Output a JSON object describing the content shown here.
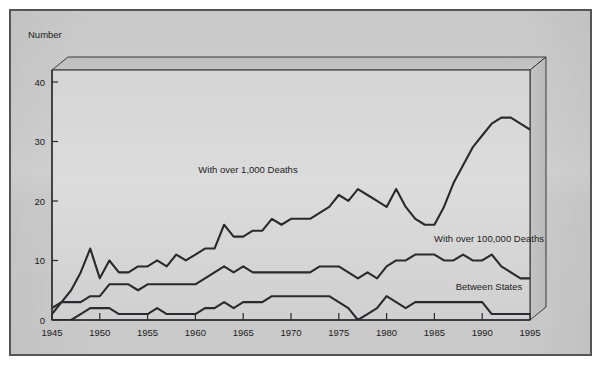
{
  "figure": {
    "background_color": "#c9c9c9",
    "plot_background_color": "#d2d2d2",
    "frame_border_color": "#555558",
    "line_color": "#2a2a2c"
  },
  "chart_data": {
    "type": "line",
    "title": "",
    "subtitle": "",
    "xlabel": "",
    "ylabel": "Number",
    "ylabel_position": "top-left",
    "xlim": [
      1945,
      1995
    ],
    "ylim": [
      0,
      42
    ],
    "yticks": [
      0,
      10,
      20,
      30,
      40
    ],
    "ytick_labels": [
      "0",
      "10",
      "20",
      "30",
      "40"
    ],
    "xticks": [
      1945,
      1950,
      1955,
      1960,
      1965,
      1970,
      1975,
      1980,
      1985,
      1990,
      1995
    ],
    "xtick_labels": [
      "1945",
      "1950",
      "1955",
      "1960",
      "1965",
      "1970",
      "1975",
      "1980",
      "1985",
      "1990",
      "1995"
    ],
    "grid": false,
    "legend_position": "inline-annotations",
    "x": [
      1945,
      1946,
      1947,
      1948,
      1949,
      1950,
      1951,
      1952,
      1953,
      1954,
      1955,
      1956,
      1957,
      1958,
      1959,
      1960,
      1961,
      1962,
      1963,
      1964,
      1965,
      1966,
      1967,
      1968,
      1969,
      1970,
      1971,
      1972,
      1973,
      1974,
      1975,
      1976,
      1977,
      1978,
      1979,
      1980,
      1981,
      1982,
      1983,
      1984,
      1985,
      1986,
      1987,
      1988,
      1989,
      1990,
      1991,
      1992,
      1993,
      1994,
      1995
    ],
    "series": [
      {
        "name": "With over 1,000 Deaths",
        "label": "With over 1,000 Deaths",
        "values": [
          2,
          3,
          5,
          8,
          12,
          7,
          10,
          8,
          8,
          9,
          9,
          10,
          9,
          11,
          10,
          11,
          12,
          12,
          16,
          14,
          14,
          15,
          15,
          17,
          16,
          17,
          17,
          17,
          18,
          19,
          21,
          20,
          22,
          21,
          20,
          19,
          22,
          19,
          17,
          16,
          16,
          19,
          23,
          26,
          29,
          31,
          33,
          34,
          34,
          33,
          32
        ],
        "annotation_x": 1963,
        "annotation_y": 22
      },
      {
        "name": "With over 100,000 Deaths",
        "label": "With over 100,000 Deaths",
        "values": [
          1,
          3,
          3,
          3,
          4,
          4,
          6,
          6,
          6,
          5,
          6,
          6,
          6,
          6,
          6,
          6,
          7,
          8,
          9,
          8,
          9,
          8,
          8,
          8,
          8,
          8,
          8,
          8,
          9,
          9,
          9,
          8,
          7,
          8,
          7,
          9,
          10,
          10,
          11,
          11,
          11,
          10,
          10,
          11,
          10,
          10,
          11,
          9,
          8,
          7,
          7
        ],
        "annotation_x": 1983,
        "annotation_y": 13
      },
      {
        "name": "Between States",
        "label": "Between States",
        "values": [
          0,
          0,
          0,
          1,
          2,
          2,
          2,
          1,
          1,
          1,
          1,
          2,
          1,
          1,
          1,
          1,
          2,
          2,
          3,
          2,
          3,
          3,
          3,
          4,
          4,
          4,
          4,
          4,
          4,
          4,
          3,
          2,
          0,
          1,
          2,
          4,
          3,
          2,
          3,
          3,
          3,
          3,
          3,
          3,
          3,
          3,
          1,
          1,
          1,
          1,
          1
        ],
        "annotation_x": 1987,
        "annotation_y": 4.5
      }
    ]
  },
  "annotations": {
    "y_axis_title": "Number"
  }
}
